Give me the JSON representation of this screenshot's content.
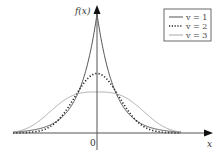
{
  "chart_data": {
    "type": "line",
    "title": "",
    "xlabel": "x",
    "ylabel": "f(x)",
    "x_tick_labels": [
      "0"
    ],
    "grid": false,
    "legend_position": "upper right",
    "x_range": [
      -3,
      4
    ],
    "series": [
      {
        "name": "v = 1",
        "style": "solid",
        "color": "#555555",
        "peak": 1.0,
        "shape": 1,
        "scale": 0.62
      },
      {
        "name": "v = 2",
        "style": "dotted",
        "color": "#222222",
        "peak": 0.5,
        "shape": 2,
        "scale": 1.12
      },
      {
        "name": "v = 3",
        "style": "solid",
        "color": "#aaaaaa",
        "peak": 0.345,
        "shape": 3,
        "scale": 1.93
      }
    ],
    "formula": "f(x) ∝ exp(-|x/scale|^v)"
  },
  "axes": {
    "y_label": "f(x)",
    "x_label": "x",
    "origin_label": "0"
  },
  "legend": {
    "items": [
      {
        "label": "v = 1",
        "style": "solid",
        "color": "#555555"
      },
      {
        "label": "v = 2",
        "style": "dotted",
        "color": "#222222"
      },
      {
        "label": "v = 3",
        "style": "solid",
        "color": "#aaaaaa"
      }
    ]
  }
}
